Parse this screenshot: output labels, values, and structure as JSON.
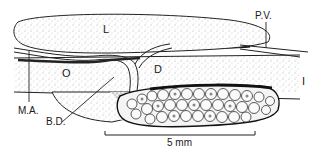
{
  "figure": {
    "type": "anatomical line drawing",
    "labels": {
      "liver": "L",
      "oesophagus": "O",
      "duodenum": "D",
      "intestine": "I",
      "portal_vein": "P.V.",
      "mesenteric_artery": "M.A.",
      "bile_duct": "B.D."
    },
    "scale_bar": {
      "label": "5 mm"
    },
    "colors": {
      "ink": "#1a1a1a",
      "stipple": "#555555",
      "background": "#ffffff"
    }
  }
}
